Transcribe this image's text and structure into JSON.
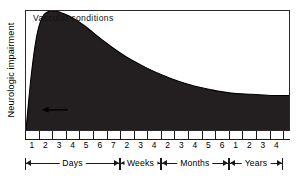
{
  "chart_data": {
    "type": "area",
    "title": "Vascular conditions",
    "xlabel": "",
    "ylabel": "Neurologic impairment",
    "grid": false,
    "legend": "none",
    "axis_note": "Time axis is piecewise: Days 1-7, Weeks 2-4, Months 2-6, Years 1-4",
    "tick_labels": [
      "1",
      "2",
      "3",
      "4",
      "5",
      "6",
      "7",
      "2",
      "3",
      "4",
      "2",
      "3",
      "4",
      "5",
      "6",
      "1",
      "2",
      "3",
      "4"
    ],
    "period_brackets": [
      {
        "label": "Days",
        "from_tick": "1",
        "to_tick": "7"
      },
      {
        "label": "Weeks",
        "from_tick": "2",
        "to_tick": "4"
      },
      {
        "label": "Months",
        "from_tick": "2",
        "to_tick": "6"
      },
      {
        "label": "Years",
        "from_tick": "1",
        "to_tick": "4"
      }
    ],
    "x": [
      0,
      2,
      4,
      6,
      8,
      11,
      14,
      18,
      22,
      26,
      30,
      35,
      40,
      46,
      52,
      58,
      64,
      70,
      78,
      86,
      94,
      100
    ],
    "y": [
      0,
      46,
      78,
      94,
      99,
      100,
      98,
      94,
      88,
      81,
      74,
      66,
      59,
      52,
      46,
      41,
      37,
      34,
      31,
      30,
      29,
      29
    ],
    "ylim": [
      0,
      100
    ],
    "xlim": [
      0,
      100
    ],
    "annotation": {
      "kind": "arrow-left",
      "label": "",
      "x_frac": 0.075,
      "y_frac": 0.83
    },
    "fill_color": "#231f20",
    "line_color": "#000000",
    "background_color": "#ffffff"
  }
}
